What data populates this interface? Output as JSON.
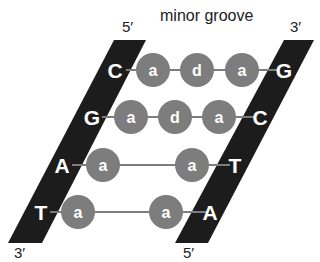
{
  "diagram": {
    "title_label": "minor groove",
    "left_strand": {
      "top_label": "5′",
      "bottom_label": "3′"
    },
    "right_strand": {
      "top_label": "3′",
      "bottom_label": "5′"
    },
    "colors": {
      "strand": "#1c1c1c",
      "circle": "#7d7d7d",
      "line": "#7d7d7d",
      "text": "#ffffff"
    },
    "rows": [
      {
        "left_base": "C",
        "right_base": "G",
        "residues": [
          "a",
          "d",
          "a"
        ]
      },
      {
        "left_base": "G",
        "right_base": "C",
        "residues": [
          "a",
          "d",
          "a"
        ]
      },
      {
        "left_base": "A",
        "right_base": "T",
        "residues": [
          "a",
          "a"
        ]
      },
      {
        "left_base": "T",
        "right_base": "A",
        "residues": [
          "a",
          "a"
        ]
      }
    ]
  }
}
